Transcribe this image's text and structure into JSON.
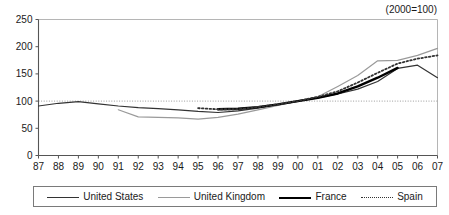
{
  "chart_data": {
    "type": "line",
    "title": "",
    "subtitle": "",
    "note": "(2000=100)",
    "xlabel": "",
    "ylabel": "",
    "xlim": [
      1987,
      2007
    ],
    "ylim": [
      0,
      250
    ],
    "yticks": [
      0,
      50,
      100,
      150,
      200,
      250
    ],
    "ytick_labels": [
      "0",
      "50",
      "100",
      "150",
      "200",
      "250"
    ],
    "x": [
      1987,
      1988,
      1989,
      1990,
      1991,
      1992,
      1993,
      1994,
      1995,
      1996,
      1997,
      1998,
      1999,
      2000,
      2001,
      2002,
      2003,
      2004,
      2005,
      2006,
      2007
    ],
    "xtick_labels": [
      "87",
      "88",
      "89",
      "90",
      "91",
      "92",
      "93",
      "94",
      "95",
      "96",
      "97",
      "98",
      "99",
      "00",
      "01",
      "02",
      "03",
      "04",
      "05",
      "06",
      "07"
    ],
    "gridlines": {
      "horizontal_at": [
        100
      ],
      "style": "dotted",
      "show_vertical": false
    },
    "legend_position": "bottom",
    "series": [
      {
        "name": "United States",
        "style": "solid",
        "width": 1.2,
        "color": "#333333",
        "x": [
          1987,
          1988,
          1989,
          1990,
          1991,
          1992,
          1993,
          1994,
          1995,
          1996,
          1997,
          1998,
          1999,
          2000,
          2001,
          2002,
          2003,
          2004,
          2005,
          2006,
          2007
        ],
        "values": [
          91,
          96,
          99,
          95,
          91,
          88,
          86,
          84,
          81,
          79,
          82,
          87,
          93,
          100,
          106,
          113,
          122,
          136,
          160,
          166,
          143
        ]
      },
      {
        "name": "United Kingdom",
        "style": "solid",
        "width": 1.2,
        "color": "#9a9a9a",
        "x": [
          1991,
          1992,
          1993,
          1994,
          1995,
          1996,
          1997,
          1998,
          1999,
          2000,
          2001,
          2002,
          2003,
          2004,
          2005,
          2006,
          2007
        ],
        "values": [
          84,
          71,
          70,
          69,
          67,
          70,
          76,
          84,
          92,
          100,
          108,
          127,
          147,
          174,
          175,
          184,
          197
        ]
      },
      {
        "name": "France",
        "style": "solid",
        "width": 2.4,
        "color": "#000000",
        "x": [
          1996,
          1997,
          1998,
          1999,
          2000,
          2001,
          2002,
          2003,
          2004,
          2005
        ],
        "values": [
          85,
          86,
          89,
          94,
          100,
          106,
          114,
          127,
          143,
          161
        ]
      },
      {
        "name": "Spain",
        "style": "dotted",
        "width": 1.8,
        "color": "#333333",
        "x": [
          1995,
          1996,
          1997,
          1998,
          1999,
          2000,
          2001,
          2002,
          2003,
          2004,
          2005,
          2006,
          2007
        ],
        "values": [
          87,
          85,
          85,
          89,
          94,
          100,
          108,
          118,
          134,
          152,
          169,
          178,
          184
        ]
      }
    ]
  },
  "legend": {
    "items": [
      {
        "label": "United States"
      },
      {
        "label": "United Kingdom"
      },
      {
        "label": "France"
      },
      {
        "label": "Spain"
      }
    ]
  },
  "colors": {
    "axis": "#555555",
    "grid": "#9a9a9a",
    "us": "#333333",
    "uk": "#9a9a9a",
    "france": "#000000",
    "spain": "#333333",
    "background": "#ffffff"
  }
}
